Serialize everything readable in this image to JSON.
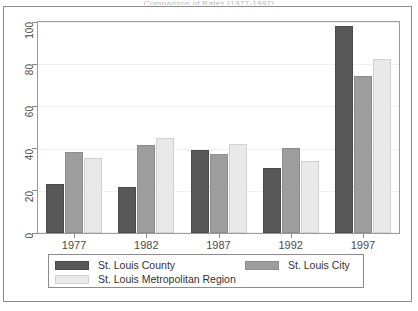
{
  "figure": {
    "clipped_caption": "Comparison of Rates (1977-1997)",
    "legend_position": "bottom"
  },
  "chart_data": {
    "type": "bar",
    "title": "",
    "subtitle": "",
    "xlabel": "",
    "ylabel": "",
    "categories": [
      "1977",
      "1982",
      "1987",
      "1992",
      "1997"
    ],
    "ylim": [
      0,
      100
    ],
    "yticks": [
      "0",
      "20",
      "40",
      "60",
      "80",
      "100"
    ],
    "ytick_values": [
      0,
      20,
      40,
      60,
      80,
      100
    ],
    "grid": false,
    "legend_position": "bottom",
    "series": [
      {
        "name": "St. Louis County",
        "color": "#585858",
        "values": [
          23,
          22,
          39.5,
          31,
          98
        ]
      },
      {
        "name": "St. Louis City",
        "color": "#9d9d9d",
        "values": [
          38.5,
          41.5,
          37.5,
          40.5,
          74.5
        ]
      },
      {
        "name": "St. Louis Metropolitan Region",
        "color": "#e9e9e9",
        "values": [
          35.5,
          45,
          42,
          34,
          82.5
        ]
      }
    ]
  }
}
